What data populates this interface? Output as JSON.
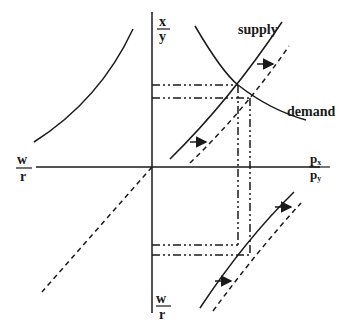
{
  "diagram": {
    "type": "four-quadrant supply-demand diagram",
    "axes": {
      "top": {
        "numerator": "x",
        "denominator": "y"
      },
      "left": {
        "numerator": "w",
        "denominator": "r"
      },
      "right": {
        "numerator": "p",
        "numerator_sub": "x",
        "denominator": "p",
        "denominator_sub": "y"
      },
      "bottom": {
        "numerator": "w",
        "denominator": "r"
      }
    },
    "curve_labels": {
      "supply": "supply",
      "demand": "demand"
    },
    "shift_arrows": 4,
    "line_color": "#1a1a1a"
  }
}
